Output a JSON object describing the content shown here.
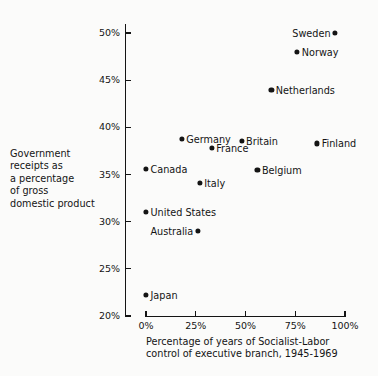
{
  "chart_data": {
    "type": "scatter",
    "title": "",
    "xlabel": "Percentage of years of Socialist-Labor control of executive branch, 1945-1969",
    "xlabel_lines": [
      "Percentage of years of Socialist-Labor",
      "control of executive branch, 1945-1969"
    ],
    "ylabel": "Government receipts as a percentage of gross domestic product",
    "ylabel_lines": [
      "Government",
      "receipts as",
      "a percentage",
      "of gross",
      "domestic product"
    ],
    "xlim": [
      0,
      100
    ],
    "ylim": [
      20,
      50
    ],
    "xticks": [
      0,
      25,
      50,
      75,
      100
    ],
    "xtick_labels": [
      "0%",
      "25%",
      "50%",
      "75%",
      "100%"
    ],
    "yticks": [
      20,
      25,
      30,
      35,
      40,
      45,
      50
    ],
    "ytick_labels": [
      "20%",
      "25%",
      "30%",
      "35%",
      "40%",
      "45%",
      "50%"
    ],
    "grid": false,
    "legend": "none",
    "marker_color": "#141414",
    "axis_color": "#141414",
    "points": [
      {
        "label": "Sweden",
        "x": 95,
        "y": 50.0,
        "label_side": "left"
      },
      {
        "label": "Norway",
        "x": 76,
        "y": 48.0,
        "label_side": "right"
      },
      {
        "label": "Netherlands",
        "x": 63,
        "y": 44.0,
        "label_side": "right"
      },
      {
        "label": "Germany",
        "x": 18,
        "y": 38.8,
        "label_side": "right"
      },
      {
        "label": "Britain",
        "x": 48,
        "y": 38.6,
        "label_side": "right"
      },
      {
        "label": "Finland",
        "x": 86,
        "y": 38.3,
        "label_side": "right"
      },
      {
        "label": "France",
        "x": 33,
        "y": 37.8,
        "label_side": "right"
      },
      {
        "label": "Canada",
        "x": 0,
        "y": 35.6,
        "label_side": "right"
      },
      {
        "label": "Belgium",
        "x": 56,
        "y": 35.5,
        "label_side": "right"
      },
      {
        "label": "Italy",
        "x": 27,
        "y": 34.1,
        "label_side": "right"
      },
      {
        "label": "United  States",
        "x": 0,
        "y": 31.0,
        "label_side": "right"
      },
      {
        "label": "Australia",
        "x": 26,
        "y": 29.0,
        "label_side": "left"
      },
      {
        "label": "Japan",
        "x": 0,
        "y": 22.2,
        "label_side": "right"
      }
    ]
  }
}
